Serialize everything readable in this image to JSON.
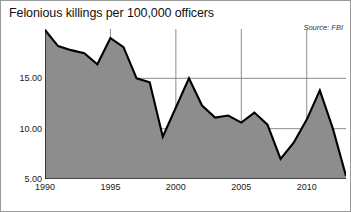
{
  "chart_data": {
    "type": "area",
    "title": "Felonious killings per 100,000 officers",
    "source_note": "Source: FBI",
    "xlabel": "",
    "ylabel": "",
    "x": [
      1990,
      1991,
      1992,
      1993,
      1994,
      1995,
      1996,
      1997,
      1998,
      1999,
      2000,
      2001,
      2002,
      2003,
      2004,
      2005,
      2006,
      2007,
      2008,
      2009,
      2010,
      2011,
      2012,
      2013
    ],
    "values": [
      19.8,
      18.2,
      17.8,
      17.5,
      16.4,
      19.0,
      18.1,
      15.0,
      14.6,
      9.2,
      12.1,
      15.0,
      12.3,
      11.1,
      11.3,
      10.6,
      11.6,
      10.4,
      7.0,
      8.6,
      10.9,
      13.8,
      10.0,
      5.3
    ],
    "x_ticks": [
      1990,
      1995,
      2000,
      2005,
      2010
    ],
    "x_tick_labels": [
      "1990",
      "1995",
      "2000",
      "2005",
      "2010"
    ],
    "y_ticks": [
      5,
      10,
      15
    ],
    "y_tick_labels": [
      "5.00",
      "10.00",
      "15.00"
    ],
    "xlim": [
      1990,
      2013
    ],
    "ylim": [
      5,
      19.9
    ],
    "grid": true,
    "legend": "none",
    "series_fill_color": "#8d8d8d",
    "series_line_color": "#000000",
    "grid_color": "#808080",
    "axis_color": "#000000",
    "background_color": "#ffffff"
  }
}
